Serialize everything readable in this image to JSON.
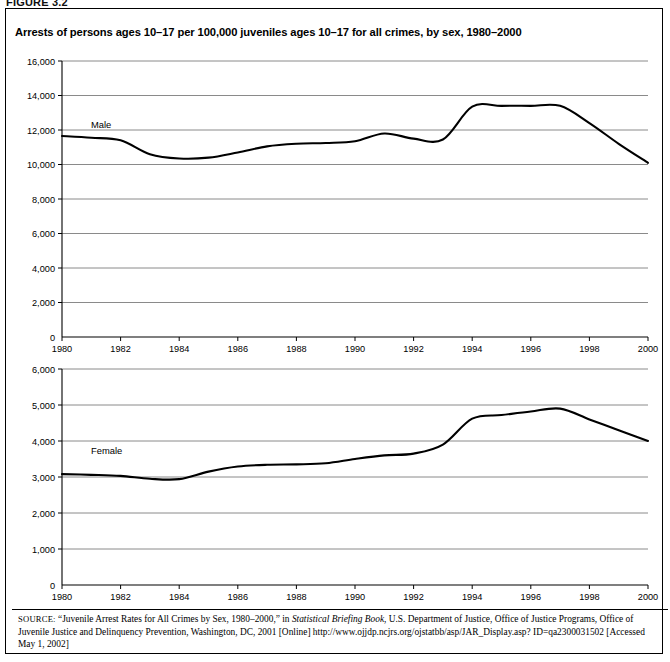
{
  "figure_label": "FIGURE 3.2",
  "title": "Arrests of persons ages 10–17 per 100,000 juveniles ages 10–17 for all crimes, by sex, 1980–2000",
  "source": {
    "label": "SOURCE:",
    "line1": "“Juvenile Arrest Rates for All Crimes by Sex, 1980–2000,” in ",
    "italic1": "Statistical Briefing Book",
    "line2": ", U.S. Department of Justice, Office of Justice Programs, Office of Juvenile Justice and Delinquency Prevention, Washington, DC, 2001 [Online] http://www.ojjdp.ncjrs.org/ojstatbb/asp/JAR_Display.asp? ID=qa2300031502 [Accessed May 1, 2002]"
  },
  "chart_data": [
    {
      "type": "line",
      "title": "Male juvenile arrest rate",
      "series_label": "Male",
      "xlabel": "",
      "ylabel": "",
      "xlim": [
        1980,
        2000
      ],
      "ylim": [
        0,
        16000
      ],
      "ytick_step": 2000,
      "xtick_step": 2,
      "grid": true,
      "legend": "inline-label",
      "ytick_labels": [
        "0",
        "2,000",
        "4,000",
        "6,000",
        "8,000",
        "10,000",
        "12,000",
        "14,000",
        "16,000"
      ],
      "xtick_labels": [
        "1980",
        "1982",
        "1984",
        "1986",
        "1988",
        "1990",
        "1992",
        "1994",
        "1996",
        "1998",
        "2000"
      ],
      "x": [
        1980,
        1981,
        1982,
        1983,
        1984,
        1985,
        1986,
        1987,
        1988,
        1989,
        1990,
        1991,
        1992,
        1993,
        1994,
        1995,
        1996,
        1997,
        1998,
        1999,
        2000
      ],
      "values": [
        11650,
        11550,
        11400,
        10600,
        10350,
        10400,
        10700,
        11050,
        11200,
        11250,
        11350,
        11800,
        11500,
        11450,
        13350,
        13400,
        13400,
        13400,
        12400,
        11200,
        10100
      ]
    },
    {
      "type": "line",
      "title": "Female juvenile arrest rate",
      "series_label": "Female",
      "xlabel": "",
      "ylabel": "",
      "xlim": [
        1980,
        2000
      ],
      "ylim": [
        0,
        6000
      ],
      "ytick_step": 1000,
      "xtick_step": 2,
      "grid": true,
      "legend": "inline-label",
      "ytick_labels": [
        "0",
        "1,000",
        "2,000",
        "3,000",
        "4,000",
        "5,000",
        "6,000"
      ],
      "xtick_labels": [
        "1980",
        "1982",
        "1984",
        "1986",
        "1988",
        "1990",
        "1992",
        "1994",
        "1996",
        "1998",
        "2000"
      ],
      "x": [
        1980,
        1981,
        1982,
        1983,
        1984,
        1985,
        1986,
        1987,
        1988,
        1989,
        1990,
        1991,
        1992,
        1993,
        1994,
        1995,
        1996,
        1997,
        1998,
        1999,
        2000
      ],
      "values": [
        3080,
        3060,
        3030,
        2950,
        2940,
        3150,
        3290,
        3340,
        3350,
        3380,
        3500,
        3600,
        3650,
        3900,
        4620,
        4720,
        4820,
        4900,
        4600,
        4300,
        4000
      ]
    }
  ]
}
